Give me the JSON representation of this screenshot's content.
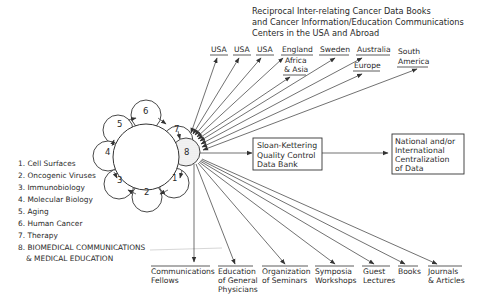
{
  "title": {
    "lines": [
      "Reciprocal Inter-relating Cancer Data Books",
      "and Cancer Information/Education Communications",
      "Centers in the USA and Abroad"
    ]
  },
  "top_targets": [
    {
      "lines": [
        "USA"
      ]
    },
    {
      "lines": [
        "USA"
      ]
    },
    {
      "lines": [
        "USA"
      ]
    },
    {
      "lines": [
        "England"
      ]
    },
    {
      "lines": [
        "Africa",
        "& Asia"
      ]
    },
    {
      "lines": [
        "Sweden"
      ]
    },
    {
      "lines": [
        "Australia"
      ]
    },
    {
      "lines": [
        "Europe"
      ]
    },
    {
      "lines": [
        "South",
        "America"
      ]
    }
  ],
  "petals": [
    "1",
    "2",
    "3",
    "4",
    "5",
    "6",
    "7",
    "8"
  ],
  "legend": [
    "1. Cell Surfaces",
    "2. Oncogenic Viruses",
    "3. Immunobiology",
    "4. Molecular Biology",
    "5. Aging",
    "6. Human Cancer",
    "7. Therapy",
    "8. BIOMEDICAL COMMUNICATIONS",
    "& MEDICAL EDUCATION"
  ],
  "boxes": {
    "sloan": [
      "Sloan-Kettering",
      "Quality Control",
      "Data Bank"
    ],
    "national": [
      "National and/or",
      "International",
      "Centralization",
      "of Data"
    ]
  },
  "bottom_targets": [
    {
      "lines": [
        "Communications",
        "Fellows"
      ]
    },
    {
      "lines": [
        "Education",
        "of General",
        "Physicians"
      ]
    },
    {
      "lines": [
        "Organization",
        "of Seminars"
      ]
    },
    {
      "lines": [
        "Symposia",
        "Workshops"
      ]
    },
    {
      "lines": [
        "Guest",
        "Lectures"
      ]
    },
    {
      "lines": [
        "Books"
      ]
    },
    {
      "lines": [
        "Journals",
        "& Articles"
      ]
    }
  ],
  "colors": {
    "ink": "#2a2a2a",
    "background": "#ffffff",
    "stipple": "#b8b8b8"
  }
}
